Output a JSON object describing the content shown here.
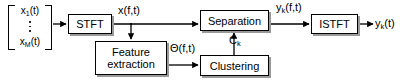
{
  "diagram": {
    "input_vector": {
      "name": "input-signal-vector",
      "first_entry": "x",
      "first_subscript": "1",
      "first_arg": "(t)",
      "last_entry": "x",
      "last_subscript": "M",
      "last_arg": "(t)",
      "ellipsis": "vertical-dots"
    },
    "blocks": [
      {
        "id": "stft",
        "label": "STFT"
      },
      {
        "id": "feature",
        "label": "Feature\nextraction"
      },
      {
        "id": "separation",
        "label": "Separation"
      },
      {
        "id": "clustering",
        "label": "Clustering"
      },
      {
        "id": "istft",
        "label": "ISTFT"
      }
    ],
    "signals": {
      "x_ft": {
        "base": "x(f,t)",
        "sub": ""
      },
      "theta_ft": {
        "base": "Θ(f,t)",
        "sub": ""
      },
      "y_k_ft": {
        "base": "y",
        "sub": "k",
        "tail": "(f,t)"
      },
      "c_k": {
        "base": "C",
        "sub": "k",
        "tail": ""
      },
      "y_k_t": {
        "base": "y",
        "sub": "k",
        "tail": "(t)"
      }
    },
    "colors": {
      "stroke": "#000000",
      "background": "#ffffff",
      "shadow": "#9a9a9a"
    }
  }
}
